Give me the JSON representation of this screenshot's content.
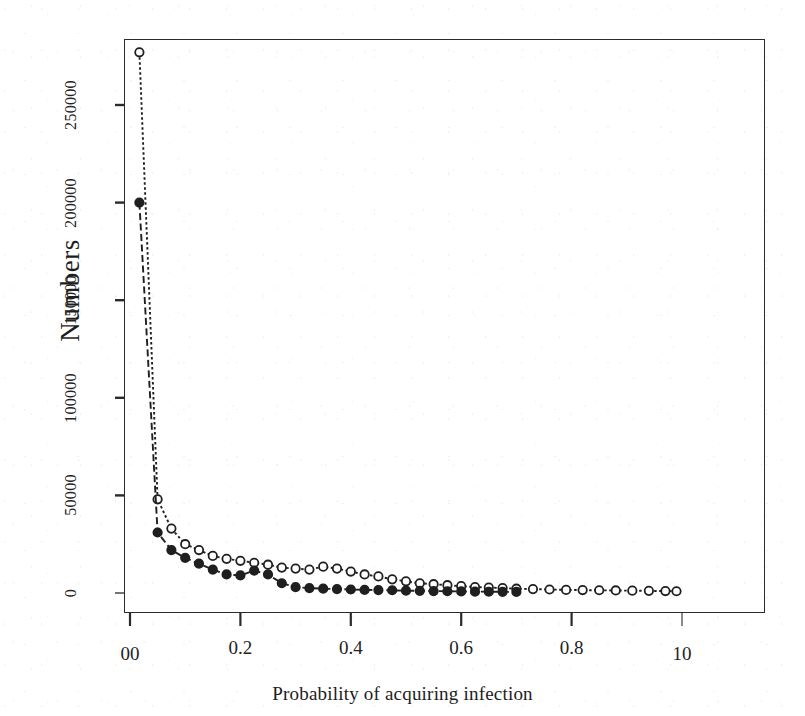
{
  "chart_data": {
    "type": "line",
    "title": "",
    "subtitle": "",
    "xlabel": "Probability of acquiring infection",
    "ylabel": "Numbers",
    "xlim": [
      0.0,
      1.0
    ],
    "ylim": [
      0,
      277000
    ],
    "grid": false,
    "legend": "none",
    "x_tick_labels": [
      "00",
      "0.2",
      "0.4",
      "0.6",
      "0.8",
      "10"
    ],
    "x_tick_values": [
      0.0,
      0.2,
      0.4,
      0.6,
      0.8,
      1.0
    ],
    "y_tick_labels": [
      "0",
      "50000",
      "100000",
      "150000",
      "200000",
      "250000"
    ],
    "y_tick_values": [
      0,
      50000,
      100000,
      150000,
      200000,
      250000
    ],
    "series": [
      {
        "name": "series-open-circle-dotted",
        "marker": "open-circle",
        "line_style": "dotted",
        "x": [
          0.017,
          0.05,
          0.075,
          0.1,
          0.125,
          0.15,
          0.175,
          0.2,
          0.225,
          0.25,
          0.275,
          0.3,
          0.325,
          0.35,
          0.375,
          0.4,
          0.425,
          0.45,
          0.475,
          0.5,
          0.525,
          0.55,
          0.575,
          0.6,
          0.625,
          0.65,
          0.675,
          0.7,
          0.73,
          0.76,
          0.79,
          0.82,
          0.85,
          0.88,
          0.91,
          0.94,
          0.97,
          0.99
        ],
        "values": [
          277000,
          48000,
          33000,
          25000,
          22000,
          19000,
          17500,
          16500,
          15500,
          14500,
          13000,
          12500,
          12000,
          13500,
          12500,
          11000,
          9500,
          8500,
          7000,
          6000,
          5000,
          4500,
          4000,
          3500,
          3000,
          2800,
          2500,
          2200,
          2000,
          1800,
          1600,
          1500,
          1400,
          1300,
          1200,
          1100,
          1000,
          900
        ]
      },
      {
        "name": "series-filled-circle-dashed",
        "marker": "filled-circle",
        "line_style": "dashed",
        "x": [
          0.017,
          0.05,
          0.075,
          0.1,
          0.125,
          0.15,
          0.175,
          0.2,
          0.225,
          0.25,
          0.275,
          0.3,
          0.325,
          0.35,
          0.375,
          0.4,
          0.425,
          0.45,
          0.475,
          0.5,
          0.525,
          0.55,
          0.575,
          0.6,
          0.625,
          0.65,
          0.675,
          0.7
        ],
        "values": [
          200000,
          31000,
          22000,
          18000,
          15000,
          12000,
          9500,
          9000,
          11500,
          9500,
          5000,
          3000,
          2500,
          2200,
          2000,
          1800,
          1600,
          1500,
          1400,
          1200,
          1100,
          1000,
          900,
          800,
          700,
          650,
          600,
          550
        ]
      }
    ],
    "annotations": []
  },
  "axis": {
    "y_title": "Numbers",
    "x_title": "Probability of acquiring infection"
  },
  "colors": {
    "line": "#1f1f1f",
    "frame": "#2b2b2b",
    "text": "#1d1d1d",
    "background": "#ffffff"
  }
}
